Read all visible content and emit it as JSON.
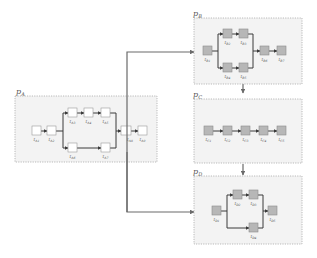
{
  "diagram": {
    "type": "process-flow",
    "panels": [
      {
        "id": "A",
        "label": "p_A",
        "label_text": "p",
        "label_sub": "A",
        "fill": "#f3f3f3",
        "task_style": "white"
      },
      {
        "id": "B",
        "label": "p_B",
        "label_text": "p",
        "label_sub": "B",
        "fill": "#f3f3f3",
        "task_style": "gray"
      },
      {
        "id": "C",
        "label": "p_C",
        "label_text": "p",
        "label_sub": "C",
        "fill": "#f3f3f3",
        "task_style": "gray"
      },
      {
        "id": "D",
        "label": "p_D",
        "label_text": "p",
        "label_sub": "D",
        "fill": "#f3f3f3",
        "task_style": "gray"
      }
    ],
    "tasks": {
      "A": [
        "t_A1",
        "t_A2",
        "t_A3",
        "t_A4",
        "t_A5",
        "t_A6",
        "t_A7",
        "t_A8",
        "t_A9"
      ],
      "B": [
        "t_B1",
        "t_B2",
        "t_B3",
        "t_B4",
        "t_B5",
        "t_B6",
        "t_B7"
      ],
      "C": [
        "t_C1",
        "t_C2",
        "t_C3",
        "t_C4",
        "t_C5"
      ],
      "D": [
        "t_D1",
        "t_D2",
        "t_D3",
        "t_D4",
        "t_D5"
      ]
    },
    "task_labels": {
      "A": [
        "A1",
        "A2",
        "A3",
        "A4",
        "A5",
        "A6",
        "A7",
        "A8",
        "A9"
      ],
      "B": [
        "B1",
        "B2",
        "B3",
        "B4",
        "B5",
        "B6",
        "B7"
      ],
      "C": [
        "C1",
        "C2",
        "C3",
        "C4",
        "C5"
      ],
      "D": [
        "D1",
        "D2",
        "D3",
        "D4",
        "D5"
      ]
    },
    "connections": [
      {
        "from": "p_A",
        "to": "p_B"
      },
      {
        "from": "p_B",
        "to": "p_C"
      },
      {
        "from": "p_C",
        "to": "p_D"
      },
      {
        "from": "p_A",
        "to": "p_D"
      }
    ],
    "colors": {
      "panel_fill": "#f3f3f3",
      "panel_border": "#a8a8a8",
      "task_white": "#ffffff",
      "task_gray": "#b7b7b7",
      "edge": "#3a3a3a",
      "link": "#6a6a6a"
    }
  }
}
